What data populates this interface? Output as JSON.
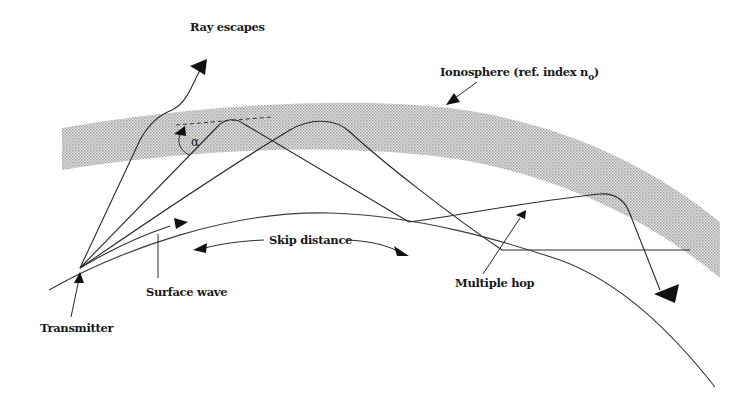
{
  "diagram": {
    "colors": {
      "line": "#2a2a2a",
      "ionosphere_fill": "#bdbdbd",
      "background": "#ffffff"
    },
    "labels": {
      "ray_escapes": "Ray escapes",
      "ionosphere": "Ionosphere (ref. index n",
      "ionosphere_subscript": "o",
      "ionosphere_close": ")",
      "alpha": "α",
      "skip_distance": "Skip distance",
      "surface_wave": "Surface wave",
      "transmitter": "Transmitter",
      "multiple_hop": "Multiple hop"
    },
    "elements": [
      {
        "name": "ionosphere-layer",
        "type": "curved band"
      },
      {
        "name": "earth-surface",
        "type": "curve"
      },
      {
        "name": "escaping-ray",
        "type": "ray",
        "note": "penetrates ionosphere"
      },
      {
        "name": "refracted-ray-1",
        "type": "ray",
        "note": "critical angle alpha"
      },
      {
        "name": "refracted-ray-2",
        "type": "ray"
      },
      {
        "name": "multiple-hop-ray",
        "type": "ray"
      },
      {
        "name": "surface-wave-ray",
        "type": "ray"
      }
    ]
  }
}
